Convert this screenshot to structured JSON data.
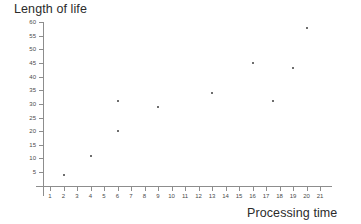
{
  "chart_data": {
    "type": "scatter",
    "title": "",
    "xlabel": "Processing time",
    "ylabel": "Length of life",
    "xlim": [
      0,
      22
    ],
    "ylim": [
      0,
      62
    ],
    "grid": false,
    "legend": null,
    "x_ticks": [
      1,
      2,
      3,
      4,
      5,
      6,
      7,
      8,
      9,
      10,
      11,
      12,
      13,
      14,
      15,
      16,
      17,
      18,
      19,
      20,
      21
    ],
    "y_ticks": [
      5,
      10,
      15,
      20,
      25,
      30,
      35,
      40,
      45,
      50,
      55,
      60
    ],
    "points": [
      {
        "x": 2,
        "y": 4
      },
      {
        "x": 4,
        "y": 11
      },
      {
        "x": 6,
        "y": 20
      },
      {
        "x": 6,
        "y": 31
      },
      {
        "x": 9,
        "y": 29
      },
      {
        "x": 13,
        "y": 34
      },
      {
        "x": 16,
        "y": 45
      },
      {
        "x": 17.5,
        "y": 31
      },
      {
        "x": 19,
        "y": 43
      },
      {
        "x": 20,
        "y": 58
      }
    ],
    "marker_color": "#6e6e6e",
    "axis_color": "#8d8d8d"
  },
  "labels": {
    "y_axis_title": "Length of life",
    "x_axis_title": "Processing time"
  }
}
